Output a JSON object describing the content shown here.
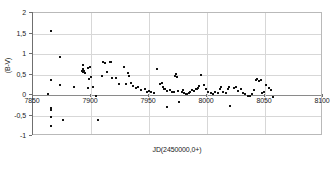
{
  "chart_data": {
    "type": "scatter",
    "title": "",
    "xlabel": "JD(2450000,0+)",
    "ylabel": "(B-V)",
    "xlim": [
      7850,
      8100
    ],
    "ylim": [
      -1,
      2
    ],
    "xticks": [
      7850,
      7900,
      7950,
      8000,
      8050,
      8100
    ],
    "xtick_labels": [
      "7850",
      "7900",
      "7950",
      "8000",
      "8050",
      "8100"
    ],
    "yticks": [
      -1,
      -0.5,
      0,
      0.5,
      1,
      1.5,
      2
    ],
    "ytick_labels": [
      "-1",
      "-0,5",
      "0",
      "0,5",
      "1",
      "1,5",
      "2"
    ],
    "grid": true,
    "legend": null,
    "marker": "square",
    "marker_color": "#111111",
    "series": [
      {
        "name": "(B-V)",
        "points": [
          [
            7866,
            1.53
          ],
          [
            7866,
            0.33
          ],
          [
            7864,
            0.01
          ],
          [
            7866,
            -0.34
          ],
          [
            7866,
            -0.4
          ],
          [
            7866,
            -0.55
          ],
          [
            7866,
            -0.77
          ],
          [
            7874,
            0.9
          ],
          [
            7874,
            0.21
          ],
          [
            7877,
            -0.64
          ],
          [
            7886,
            0.17
          ],
          [
            7893,
            0.56
          ],
          [
            7894,
            0.53
          ],
          [
            7894,
            0.6
          ],
          [
            7894,
            0.7
          ],
          [
            7895,
            0.57
          ],
          [
            7896,
            0.52
          ],
          [
            7898,
            0.64
          ],
          [
            7898,
            0.14
          ],
          [
            7899,
            0.37
          ],
          [
            7900,
            0.66
          ],
          [
            7901,
            0.42
          ],
          [
            7903,
            0.17
          ],
          [
            7905,
            -0.05
          ],
          [
            7907,
            -0.64
          ],
          [
            7910,
            0.43
          ],
          [
            7911,
            0.78
          ],
          [
            7913,
            0.76
          ],
          [
            7915,
            0.53
          ],
          [
            7917,
            0.78
          ],
          [
            7918,
            0.78
          ],
          [
            7919,
            0.4
          ],
          [
            7922,
            0.38
          ],
          [
            7925,
            0.25
          ],
          [
            7929,
            0.66
          ],
          [
            7931,
            0.25
          ],
          [
            7933,
            0.52
          ],
          [
            7934,
            0.45
          ],
          [
            7935,
            0.28
          ],
          [
            7937,
            0.2
          ],
          [
            7940,
            0.14
          ],
          [
            7941,
            0.17
          ],
          [
            7944,
            0.1
          ],
          [
            7947,
            0.11
          ],
          [
            7949,
            0.06
          ],
          [
            7951,
            0.08
          ],
          [
            7953,
            0.05
          ],
          [
            7955,
            0.02
          ],
          [
            7958,
            0.62
          ],
          [
            7960,
            0.24
          ],
          [
            7962,
            0.28
          ],
          [
            7963,
            0.16
          ],
          [
            7964,
            0.13
          ],
          [
            7965,
            0.11
          ],
          [
            7966,
            0.08
          ],
          [
            7966,
            -0.31
          ],
          [
            7969,
            0.1
          ],
          [
            7971,
            0.06
          ],
          [
            7972,
            0.04
          ],
          [
            7973,
            0.44
          ],
          [
            7974,
            0.5
          ],
          [
            7975,
            0.41
          ],
          [
            7976,
            0.08
          ],
          [
            7977,
            -0.19
          ],
          [
            7979,
            0.06
          ],
          [
            7980,
            0.1
          ],
          [
            7981,
            0.03
          ],
          [
            7983,
            0.0
          ],
          [
            7984,
            -0.01
          ],
          [
            7985,
            0.02
          ],
          [
            7986,
            0.06
          ],
          [
            7988,
            0.1
          ],
          [
            7990,
            0.08
          ],
          [
            7991,
            0.13
          ],
          [
            7992,
            0.12
          ],
          [
            7993,
            0.15
          ],
          [
            7994,
            0.2
          ],
          [
            7996,
            0.47
          ],
          [
            7998,
            0.22
          ],
          [
            8000,
            0.12
          ],
          [
            8002,
            0.05
          ],
          [
            8004,
            0.03
          ],
          [
            8006,
            0.01
          ],
          [
            8008,
            0.05
          ],
          [
            8010,
            0.02
          ],
          [
            8012,
            0.13
          ],
          [
            8013,
            0.16
          ],
          [
            8015,
            0.06
          ],
          [
            8017,
            0.03
          ],
          [
            8019,
            0.12
          ],
          [
            8020,
            0.16
          ],
          [
            8021,
            -0.3
          ],
          [
            8024,
            0.14
          ],
          [
            8026,
            0.18
          ],
          [
            8028,
            0.08
          ],
          [
            8030,
            0.11
          ],
          [
            8032,
            0.02
          ],
          [
            8034,
            0.0
          ],
          [
            8036,
            -0.04
          ],
          [
            8038,
            -0.06
          ],
          [
            8040,
            0.01
          ],
          [
            8041,
            0.1
          ],
          [
            8043,
            0.34
          ],
          [
            8044,
            0.36
          ],
          [
            8046,
            0.31
          ],
          [
            8047,
            0.35
          ],
          [
            8048,
            0.02
          ],
          [
            8050,
            0.05
          ],
          [
            8052,
            0.22
          ],
          [
            8054,
            0.14
          ],
          [
            8056,
            0.1
          ],
          [
            8058,
            -0.07
          ]
        ]
      }
    ]
  },
  "caption": {
    "text": ""
  }
}
